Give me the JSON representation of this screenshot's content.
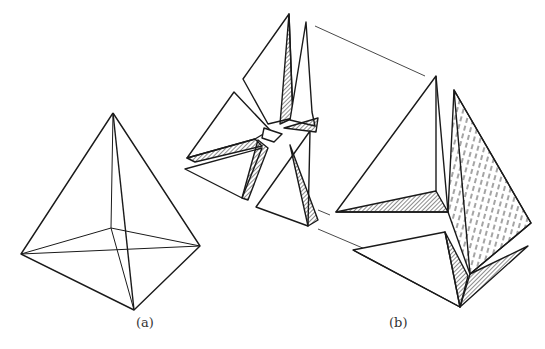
{
  "figure": {
    "labels": {
      "a": "(a)",
      "b": "(b)"
    },
    "colors": {
      "ink": "#1a1a1a",
      "background": "#ffffff"
    },
    "panels": [
      {
        "id": "a",
        "description": "tetrahedron wireframe"
      },
      {
        "id": "b",
        "description": "exploded tetrahedron pieces with enlarged detail"
      }
    ]
  }
}
